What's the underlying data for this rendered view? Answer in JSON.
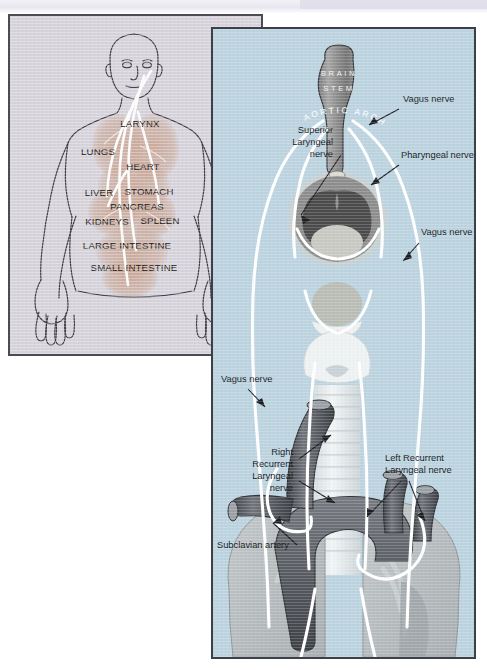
{
  "figure": {
    "colors": {
      "left_panel_bg": "#d6d3db",
      "right_panel_bg": "#bcd3e0",
      "panel_border_left": "#4c4a52",
      "panel_border_right": "#3d4147",
      "nerve_white": "#ffffff",
      "organ_tint": "#c6a391",
      "brainstem_gray": "#8e8e8e",
      "larynx_gray": "#8a8a8a",
      "larynx_dark": "#4a4a4a",
      "artery_dark": "#4e5055",
      "artery_mid": "#6e7278",
      "lung_gray": "#b6bcbe",
      "label_text": "#17181c"
    }
  },
  "left_panel": {
    "name": "body-distribution-diagram",
    "organ_labels": [
      {
        "text": "LARYNX",
        "x": 130,
        "y": 111
      },
      {
        "text": "LUNGS",
        "x": 88,
        "y": 139
      },
      {
        "text": "HEART",
        "x": 130,
        "y": 154
      },
      {
        "text": "LIVER",
        "x": 89,
        "y": 180
      },
      {
        "text": "STOMACH",
        "x": 127,
        "y": 179
      },
      {
        "text": "PANCREAS",
        "x": 112,
        "y": 193
      },
      {
        "text": "KIDNEYS",
        "x": 92,
        "y": 209
      },
      {
        "text": "SPLEEN",
        "x": 141,
        "y": 208
      },
      {
        "text": "LARGE INTESTINE",
        "x": 92,
        "y": 233
      },
      {
        "text": "SMALL INTESTINE",
        "x": 100,
        "y": 255
      }
    ]
  },
  "right_panel": {
    "name": "laryngeal-nerve-diagram",
    "structure_labels": [
      {
        "text": "BRAIN",
        "id": "brain-stem-line-1"
      },
      {
        "text": "STEM",
        "id": "brain-stem-line-2"
      },
      {
        "text": "AORTIC ARCH",
        "id": "aortic-arch-label"
      }
    ],
    "callouts": [
      {
        "id": "vagus-nerve-top",
        "lines": [
          "Vagus nerve"
        ],
        "x": 399,
        "y": 99,
        "anchor": "start"
      },
      {
        "id": "pharyngeal-nerve",
        "lines": [
          "Pharyngeal nerve"
        ],
        "x": 397,
        "y": 155,
        "anchor": "start"
      },
      {
        "id": "vagus-nerve-mid",
        "lines": [
          "Vagus nerve"
        ],
        "x": 417,
        "y": 232,
        "anchor": "start"
      },
      {
        "id": "superior-laryngeal-nerve",
        "lines": [
          "Superior",
          "Laryngeal",
          "nerve"
        ],
        "x": 330,
        "y": 137,
        "anchor": "end"
      },
      {
        "id": "vagus-nerve-lower-left",
        "lines": [
          "Vagus nerve"
        ],
        "x": 222,
        "y": 375,
        "anchor": "start"
      },
      {
        "id": "right-recurrent-laryngeal-nerve",
        "lines": [
          "Right",
          "Recurrent",
          "Laryngeal",
          "nerve"
        ],
        "x": 284,
        "y": 459,
        "anchor": "end"
      },
      {
        "id": "left-recurrent-laryngeal-nerve",
        "lines": [
          "Left Recurrent",
          "Laryngeal nerve"
        ],
        "x": 385,
        "y": 465,
        "anchor": "start"
      },
      {
        "id": "subclavian-artery",
        "lines": [
          "Subclavian artery"
        ],
        "x": 217,
        "y": 541,
        "anchor": "start"
      }
    ]
  }
}
